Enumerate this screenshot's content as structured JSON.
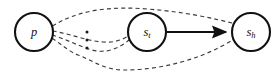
{
  "diagram": {
    "background_color": "#ffffff",
    "node_stroke_color": "#111111",
    "solid_edge_color": "#111111",
    "dashed_edge_color": "#3a3a3a",
    "nodes": [
      {
        "id": "p",
        "label": "p",
        "subscript": "",
        "cx": 34,
        "cy": 32,
        "r": 19
      },
      {
        "id": "s_t",
        "label": "s",
        "subscript": "t",
        "cx": 147,
        "cy": 32,
        "r": 19
      },
      {
        "id": "s_h",
        "label": "s",
        "subscript": "h",
        "cx": 251,
        "cy": 32,
        "r": 19
      }
    ],
    "solid_edges": [
      {
        "id": "st-to-sh",
        "from": "s_t",
        "to": "s_h",
        "style": "solid",
        "arrowhead": "filled-triangle"
      }
    ],
    "dashed_edges": [
      {
        "id": "p-to-sh-top",
        "from": "p",
        "to": "s_h",
        "style": "dashed"
      },
      {
        "id": "p-to-st-upper",
        "from": "p",
        "to": "s_t",
        "style": "dashed"
      },
      {
        "id": "p-to-st-lower",
        "from": "p",
        "to": "s_t",
        "style": "dashed"
      },
      {
        "id": "p-to-sh-bottom",
        "from": "p",
        "to": "s_h",
        "style": "dashed"
      }
    ],
    "ellipsis": {
      "id": "vertical-ellipsis",
      "symbol": "vdots",
      "dot_count": 3,
      "x": 87,
      "y_start": 32,
      "y_step": 8
    }
  }
}
